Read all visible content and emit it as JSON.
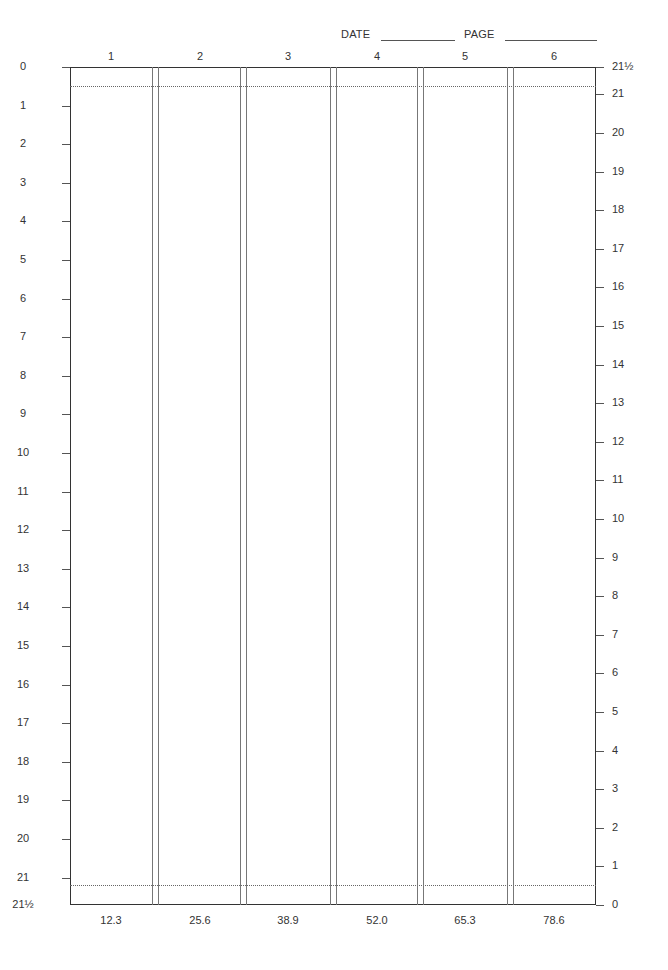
{
  "header": {
    "date_label": "DATE",
    "page_label": "PAGE"
  },
  "columns": {
    "top_labels": [
      "1",
      "2",
      "3",
      "4",
      "5",
      "6"
    ],
    "bottom_values": [
      "12.3",
      "25.6",
      "38.9",
      "52.0",
      "65.3",
      "78.6"
    ]
  },
  "scales": {
    "left": [
      "0",
      "1",
      "2",
      "3",
      "4",
      "5",
      "6",
      "7",
      "8",
      "9",
      "10",
      "11",
      "12",
      "13",
      "14",
      "15",
      "16",
      "17",
      "18",
      "19",
      "20",
      "21",
      "21½"
    ],
    "right": [
      "21½",
      "21",
      "20",
      "19",
      "18",
      "17",
      "16",
      "15",
      "14",
      "13",
      "12",
      "11",
      "10",
      "9",
      "8",
      "7",
      "6",
      "5",
      "4",
      "3",
      "2",
      "1",
      "0"
    ]
  }
}
